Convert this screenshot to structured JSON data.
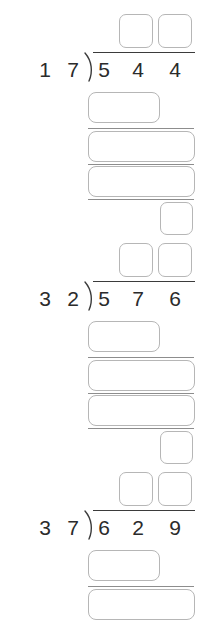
{
  "worksheet": {
    "type": "long-division-practice",
    "background_color": "#ffffff",
    "digit_color": "#2b2b2b",
    "box_border_color": "#b6b6b6",
    "rule_color": "#8d8d8d",
    "problems": [
      {
        "id": "problem-1",
        "divisor": "17",
        "divisor_digits": [
          "1",
          "7"
        ],
        "dividend": "544",
        "dividend_digits": [
          "5",
          "4",
          "4"
        ],
        "quotient_boxes": [
          "",
          ""
        ],
        "partial_product_box": "",
        "work_boxes": [
          "",
          ""
        ],
        "remainder_box": ""
      },
      {
        "id": "problem-2",
        "divisor": "32",
        "divisor_digits": [
          "3",
          "2"
        ],
        "dividend": "576",
        "dividend_digits": [
          "5",
          "7",
          "6"
        ],
        "quotient_boxes": [
          "",
          ""
        ],
        "partial_product_box": "",
        "work_boxes": [
          "",
          ""
        ],
        "remainder_box": ""
      },
      {
        "id": "problem-3",
        "divisor": "37",
        "divisor_digits": [
          "3",
          "7"
        ],
        "dividend": "629",
        "dividend_digits": [
          "6",
          "2",
          "9"
        ],
        "quotient_boxes": [
          "",
          ""
        ],
        "partial_product_box": "",
        "work_boxes": [
          ""
        ],
        "remainder_box": ""
      }
    ]
  }
}
